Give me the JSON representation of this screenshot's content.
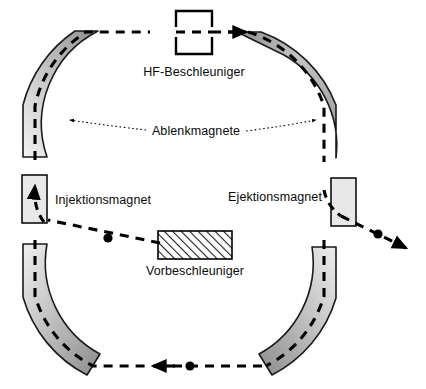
{
  "diagram": {
    "type": "schematic",
    "background_color": "#ffffff",
    "stroke_color": "#000000",
    "labels": {
      "rf_accelerator": "HF-Beschleuniger",
      "bending_magnets": "Ablenkmagnete",
      "injection_magnet": "Injektionsmagnet",
      "ejection_magnet": "Ejektionsmagnet",
      "preaccelerator": "Vorbeschleuniger"
    },
    "components": [
      {
        "name": "rf-accelerator",
        "label": "HF-Beschleuniger",
        "shape": "open-rectangle",
        "fill": "#ffffff",
        "stroke": "#000000"
      },
      {
        "name": "bending-magnet-arc",
        "label": "Ablenkmagnete",
        "shape": "arc-segment",
        "count": 4,
        "fill_gradient_light": "#eeeeee",
        "fill_gradient_dark": "#8c8c8c",
        "stroke": "#000000"
      },
      {
        "name": "injection-magnet",
        "label": "Injektionsmagnet",
        "shape": "rectangle",
        "fill": "#e8e8e8",
        "stroke": "#000000"
      },
      {
        "name": "ejection-magnet",
        "label": "Ejektionsmagnet",
        "shape": "rectangle",
        "fill": "#e8e8e8",
        "stroke": "#000000"
      },
      {
        "name": "preaccelerator",
        "label": "Vorbeschleuniger",
        "shape": "hatched-rectangle",
        "fill": "#ffffff",
        "hatch": "diagonal-45",
        "stroke": "#000000"
      }
    ],
    "beam": {
      "name": "particle-beam-path",
      "style": "dashed",
      "color": "#000000",
      "particle_marker": "filled-circle",
      "particle_count": 3,
      "direction_arrows": 4
    },
    "leader_lines": {
      "style": "dotted",
      "color": "#000000",
      "arrowheads": 2
    }
  }
}
